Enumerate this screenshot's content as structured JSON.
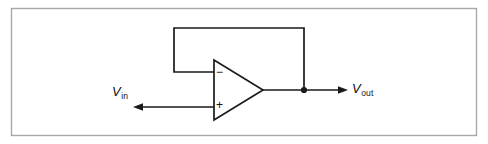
{
  "figure": {
    "type": "circuit-schematic",
    "name": "voltage-follower-op-amp",
    "border_color": "#a8a8a8",
    "wire_color": "#1a1a1a",
    "background": "#ffffff"
  },
  "labels": {
    "input": {
      "symbol": "V",
      "subscript": "in",
      "full": "Vin"
    },
    "output": {
      "symbol": "V",
      "subscript": "out",
      "full": "Vout"
    }
  },
  "opamp": {
    "name": "operational-amplifier",
    "inverting_sign": "−",
    "noninverting_sign": "+",
    "inverting_input_position": "top",
    "noninverting_input_position": "bottom"
  },
  "nodes": {
    "output_junction": {
      "label": "",
      "x": 304,
      "y": 90
    }
  },
  "wires": [
    {
      "name": "input-wire",
      "from": "Vin-arrow",
      "to": "noninverting-input"
    },
    {
      "name": "output-wire",
      "from": "opamp-output",
      "to": "Vout-arrow"
    },
    {
      "name": "feedback-wire",
      "from": "output-junction",
      "to": "inverting-input"
    }
  ],
  "arrows": {
    "input_direction": "left",
    "output_direction": "right"
  }
}
